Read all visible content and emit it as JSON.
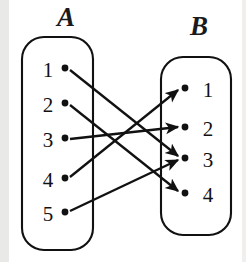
{
  "figure": {
    "title": "",
    "type": "mapping-diagram",
    "colors": {
      "stroke": "#111111",
      "background": "#ffffff",
      "dot": "#111111",
      "scan_band": "#e9e9e7"
    }
  },
  "sets": {
    "left": {
      "name": "A",
      "label_x": 57,
      "label_y": 4,
      "box": {
        "x": 22,
        "y": 37,
        "w": 71,
        "h": 213,
        "r": 22
      },
      "elements": [
        {
          "label": "1",
          "text_x": 38,
          "text_y": 60,
          "dot_x": 65,
          "dot_y": 68
        },
        {
          "label": "2",
          "text_x": 38,
          "text_y": 95,
          "dot_x": 65,
          "dot_y": 103
        },
        {
          "label": "3",
          "text_x": 38,
          "text_y": 130,
          "dot_x": 65,
          "dot_y": 138
        },
        {
          "label": "4",
          "text_x": 38,
          "text_y": 170,
          "dot_x": 65,
          "dot_y": 178
        },
        {
          "label": "5",
          "text_x": 38,
          "text_y": 204,
          "dot_x": 65,
          "dot_y": 212
        }
      ]
    },
    "right": {
      "name": "B",
      "label_x": 190,
      "label_y": 13,
      "box": {
        "x": 161,
        "y": 57,
        "w": 70,
        "h": 178,
        "r": 22
      },
      "elements": [
        {
          "label": "1",
          "text_x": 198,
          "text_y": 80,
          "dot_x": 185,
          "dot_y": 88
        },
        {
          "label": "2",
          "text_x": 198,
          "text_y": 119,
          "dot_x": 185,
          "dot_y": 127
        },
        {
          "label": "3",
          "text_x": 198,
          "text_y": 150,
          "dot_x": 185,
          "dot_y": 158
        },
        {
          "label": "4",
          "text_x": 198,
          "text_y": 185,
          "dot_x": 185,
          "dot_y": 193
        }
      ]
    }
  },
  "chart_data": {
    "type": "mapping",
    "domain_set": "A",
    "codomain_set": "B",
    "domain_elements": [
      "1",
      "2",
      "3",
      "4",
      "5"
    ],
    "codomain_elements": [
      "1",
      "2",
      "3",
      "4"
    ],
    "arrows": [
      {
        "from": "A1",
        "to": "B3",
        "x1": 70,
        "y1": 70,
        "x2": 178,
        "y2": 156
      },
      {
        "from": "A2",
        "to": "B4",
        "x1": 70,
        "y1": 105,
        "x2": 178,
        "y2": 191
      },
      {
        "from": "A3",
        "to": "B2",
        "x1": 70,
        "y1": 139,
        "x2": 178,
        "y2": 127
      },
      {
        "from": "A4",
        "to": "B1",
        "x1": 70,
        "y1": 177,
        "x2": 178,
        "y2": 90
      },
      {
        "from": "A5",
        "to": "B3",
        "x1": 70,
        "y1": 211,
        "x2": 178,
        "y2": 160
      }
    ],
    "pairs": [
      [
        "1",
        "3"
      ],
      [
        "2",
        "4"
      ],
      [
        "3",
        "2"
      ],
      [
        "4",
        "1"
      ],
      [
        "5",
        "3"
      ]
    ]
  }
}
